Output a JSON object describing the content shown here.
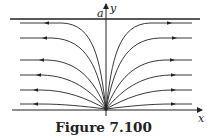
{
  "figure": {
    "caption": "Figure 7.100",
    "labels": {
      "x_axis": "x",
      "y_axis": "y",
      "asymptote": "a"
    },
    "colors": {
      "stroke": "#222222",
      "background": "#ffffff"
    },
    "trajectory_levels_px": [
      23,
      38,
      60,
      75,
      90,
      104
    ],
    "arrow_direction": "outward (away from y-axis)"
  }
}
